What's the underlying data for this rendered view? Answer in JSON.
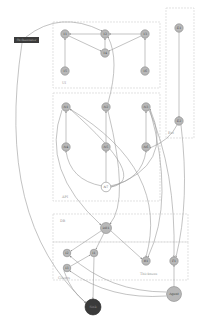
{
  "diagram": {
    "type": "directed-graph",
    "clusters": [
      {
        "id": "c1",
        "label": "UI",
        "x": 53,
        "y": 22,
        "w": 107,
        "h": 66
      },
      {
        "id": "c2",
        "label": "API",
        "x": 53,
        "y": 93,
        "w": 107,
        "h": 108
      },
      {
        "id": "c_right",
        "label": "Ext",
        "x": 166,
        "y": 8,
        "w": 28,
        "h": 130
      },
      {
        "id": "c3",
        "label": "DB",
        "x": 53,
        "y": 214,
        "w": 135,
        "h": 28
      },
      {
        "id": "c4",
        "label": "Clients",
        "x": 53,
        "y": 242,
        "w": 135,
        "h": 38
      },
      {
        "id": "c4b",
        "label": "Thickness",
        "x": 0,
        "y": 0,
        "w": 0,
        "h": 0
      }
    ],
    "cluster_labels": {
      "c1": "UI",
      "c2": "API",
      "c_right": "Ext",
      "c3": "DB",
      "c4": "Clients",
      "c4b": "Thickness"
    },
    "rect_node": {
      "id": "R",
      "label": "Orchestrator",
      "x": 14,
      "y": 37,
      "w": 25,
      "h": 6
    },
    "nodes": [
      {
        "id": "T1",
        "label": "T1",
        "x": 65,
        "y": 34,
        "r": 4.2,
        "style": "grey"
      },
      {
        "id": "T2",
        "label": "T2",
        "x": 105,
        "y": 34,
        "r": 4.2,
        "style": "grey"
      },
      {
        "id": "T3",
        "label": "T3",
        "x": 145,
        "y": 34,
        "r": 4.2,
        "style": "grey"
      },
      {
        "id": "T4",
        "label": "T4",
        "x": 105,
        "y": 53,
        "r": 4.2,
        "style": "grey"
      },
      {
        "id": "T5",
        "label": "T5",
        "x": 65,
        "y": 71,
        "r": 4.2,
        "style": "grey"
      },
      {
        "id": "T6",
        "label": "T6",
        "x": 145,
        "y": 71,
        "r": 4.2,
        "style": "grey"
      },
      {
        "id": "E1",
        "label": "E1",
        "x": 179,
        "y": 28,
        "r": 4.2,
        "style": "grey"
      },
      {
        "id": "E2",
        "label": "E2",
        "x": 179,
        "y": 121,
        "r": 4.2,
        "style": "grey"
      },
      {
        "id": "N1",
        "label": "N1",
        "x": 66,
        "y": 107,
        "r": 4.2,
        "style": "grey"
      },
      {
        "id": "N2",
        "label": "N2",
        "x": 106,
        "y": 107,
        "r": 4.2,
        "style": "grey"
      },
      {
        "id": "N3",
        "label": "N3",
        "x": 146,
        "y": 107,
        "r": 4.2,
        "style": "grey"
      },
      {
        "id": "N4",
        "label": "N4",
        "x": 66,
        "y": 147,
        "r": 4.2,
        "style": "grey"
      },
      {
        "id": "N5",
        "label": "N5",
        "x": 106,
        "y": 147,
        "r": 4.2,
        "style": "grey"
      },
      {
        "id": "N6",
        "label": "N6",
        "x": 146,
        "y": 147,
        "r": 4.2,
        "style": "grey"
      },
      {
        "id": "N7",
        "label": "N7",
        "x": 106,
        "y": 187,
        "r": 4.8,
        "style": "white"
      },
      {
        "id": "DB1",
        "label": "DB1",
        "x": 106,
        "y": 228,
        "r": 5.5,
        "style": "grey"
      },
      {
        "id": "I2",
        "label": "I2",
        "x": 67,
        "y": 253,
        "r": 3.8,
        "style": "grey"
      },
      {
        "id": "I1",
        "label": "I1",
        "x": 94,
        "y": 253,
        "r": 3.8,
        "style": "grey"
      },
      {
        "id": "I3",
        "label": "I3",
        "x": 67,
        "y": 268,
        "r": 3.8,
        "style": "grey"
      },
      {
        "id": "R1",
        "label": "R1",
        "x": 146,
        "y": 261,
        "r": 4.2,
        "style": "grey"
      },
      {
        "id": "F1",
        "label": "F1",
        "x": 174,
        "y": 261,
        "r": 4.2,
        "style": "grey"
      },
      {
        "id": "Agent",
        "label": "Agent",
        "x": 174,
        "y": 294,
        "r": 7.5,
        "style": "grey"
      },
      {
        "id": "Sink",
        "label": "Sink",
        "x": 93,
        "y": 307,
        "r": 8,
        "style": "dark"
      }
    ],
    "edges": [
      {
        "from": "T2",
        "to": "T1",
        "d": "M100.8,34 L69.2,34"
      },
      {
        "from": "T3",
        "to": "T2",
        "d": "M140.8,34 L109.2,34"
      },
      {
        "from": "T1",
        "to": "T4",
        "d": "M69,36 L101,51"
      },
      {
        "from": "T3",
        "to": "T4",
        "d": "M141,36 L109,51"
      },
      {
        "from": "T4",
        "to": "T2",
        "d": "M105,48.8 L105,38.2"
      },
      {
        "from": "T5",
        "to": "T1",
        "d": "M65,66.8 L65,38.2"
      },
      {
        "from": "T6",
        "to": "T3",
        "d": "M145,66.8 L145,38.2"
      },
      {
        "from": "E1",
        "to": "E2",
        "d": "M179,32 L179,117"
      },
      {
        "from": "N4",
        "to": "N1",
        "d": "M66,142.8 L66,111.2"
      },
      {
        "from": "N5",
        "to": "N2",
        "d": "M106,142.8 L106,111.2"
      },
      {
        "from": "N6",
        "to": "N3",
        "d": "M146,142.8 L146,111.2"
      },
      {
        "from": "N7",
        "to": "N4",
        "d": "M102,186 Q70,180 66,151"
      },
      {
        "from": "N7",
        "to": "N5",
        "d": "M106,182 L106,151"
      },
      {
        "from": "N7",
        "to": "N6",
        "d": "M110,186 Q142,180 146,151"
      },
      {
        "from": "N7",
        "to": "N1",
        "d": "M111,187 Q150,180 70,109"
      },
      {
        "from": "N7",
        "to": "N3",
        "d": "M111,187 Q175,165 150,109"
      },
      {
        "from": "N2",
        "to": "T2",
        "d": "M108,103 Q120,60 108,37"
      },
      {
        "from": "R",
        "to": "T2",
        "d": "M26,37 Q60,10 102,31"
      },
      {
        "from": "R",
        "to": "Sink",
        "d": "M22,43 Q-5,220 86,303"
      },
      {
        "from": "N1",
        "to": "DB1",
        "d": "M62,110 Q40,170 101,225"
      },
      {
        "from": "N2",
        "to": "DB1",
        "d": "M108,111 Q130,200 110,224"
      },
      {
        "from": "N1",
        "to": "R1",
        "d": "M70,109 Q170,170 146,257"
      },
      {
        "from": "N3",
        "to": "R1",
        "d": "M150,110 Q175,200 148,257"
      },
      {
        "from": "E2",
        "to": "N6",
        "d": "M177,125 Q170,140 150,148"
      },
      {
        "from": "N3",
        "to": "F1",
        "d": "M149,110 Q176,170 174,257"
      },
      {
        "from": "E2",
        "to": "F1",
        "d": "M181,125 Q190,200 176,257"
      },
      {
        "from": "DB1",
        "to": "I2",
        "d": "M101,231 L71,251"
      },
      {
        "from": "DB1",
        "to": "I1",
        "d": "M104,233 L96,249"
      },
      {
        "from": "DB1",
        "to": "R1",
        "d": "M111,231 L142,259"
      },
      {
        "from": "I3",
        "to": "I1",
        "d": "M71,266 L90,255"
      },
      {
        "from": "I1",
        "to": "Sink",
        "d": "M94,257 L93,299"
      },
      {
        "from": "F1",
        "to": "Agent",
        "d": "M174,286.5 L174,265"
      },
      {
        "from": "Agent",
        "to": "I2",
        "d": "M166,292 Q110,292 70,256"
      },
      {
        "from": "Agent",
        "to": "I3",
        "d": "M166,296 Q110,300 70,271"
      },
      {
        "from": "I3",
        "to": "Sink",
        "d": "M64,271 Q70,290 86,303"
      }
    ],
    "colors": {
      "node_fill": "#b8b8b8",
      "node_stroke": "#8a8a8a",
      "dark_node": "#3a3a3a",
      "edge": "#9a9a9a",
      "cluster_border": "#d6d6d6"
    }
  }
}
